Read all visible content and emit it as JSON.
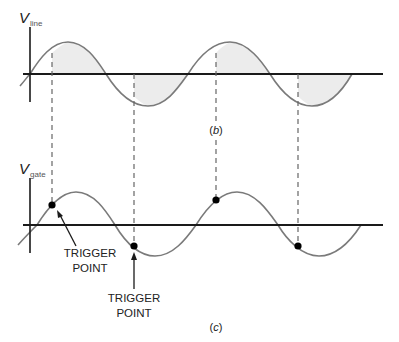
{
  "diagram": {
    "top_panel": {
      "axis_label_main": "V",
      "axis_label_sub": "line",
      "panel_label_open": "(",
      "panel_label_letter": "b",
      "panel_label_close": ")"
    },
    "bottom_panel": {
      "axis_label_main": "V",
      "axis_label_sub": "gate",
      "panel_label_open": "(",
      "panel_label_letter": "c",
      "panel_label_close": ")"
    },
    "annotations": [
      {
        "line1": "TRIGGER",
        "line2": "POINT"
      },
      {
        "line1": "TRIGGER",
        "line2": "POINT"
      }
    ],
    "colors": {
      "axis": "#1a1a1a",
      "wave": "#7a7a7a",
      "shade": "#ececec",
      "dash": "#666666",
      "dot": "#000000"
    }
  }
}
